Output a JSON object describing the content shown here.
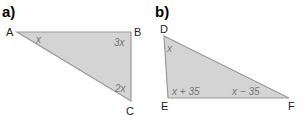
{
  "parts": [
    {
      "label": "a)",
      "vertices": [
        {
          "name": "A",
          "angle": "x"
        },
        {
          "name": "B",
          "angle": "3x"
        },
        {
          "name": "C",
          "angle": "2x"
        }
      ]
    },
    {
      "label": "b)",
      "vertices": [
        {
          "name": "D",
          "angle": "x"
        },
        {
          "name": "E",
          "angle": "x + 35"
        },
        {
          "name": "F",
          "angle": "x − 35"
        }
      ]
    }
  ],
  "colors": {
    "fill": "#d4d4d4",
    "stroke": "#9a9a9a",
    "angle_text": "#777777"
  }
}
